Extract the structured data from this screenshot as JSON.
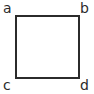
{
  "figure": {
    "name": "labelled-square",
    "canvas": {
      "width": 94,
      "height": 94,
      "background": "#ffffff"
    },
    "shape": {
      "type": "square",
      "fill": "none",
      "stroke_color": "#2b2b2b",
      "stroke_width": 2,
      "left": 15,
      "top": 15,
      "size": 64
    },
    "vertices": [
      {
        "id": "a",
        "label": "a",
        "position": "top-left"
      },
      {
        "id": "b",
        "label": "b",
        "position": "top-right"
      },
      {
        "id": "c",
        "label": "c",
        "position": "bottom-left"
      },
      {
        "id": "d",
        "label": "d",
        "position": "bottom-right"
      }
    ]
  }
}
